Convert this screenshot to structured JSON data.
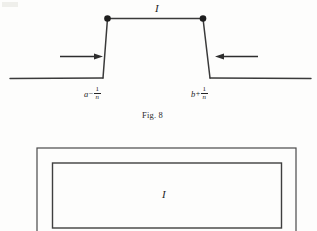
{
  "figure_top": {
    "name": "step-function-trapezoid-figure",
    "caption": "Fig. 8",
    "plateau_label": "I",
    "left_tick": {
      "variable": "a",
      "operator": "−",
      "numerator": "1",
      "denominator": "n"
    },
    "right_tick": {
      "variable": "b",
      "operator": "+",
      "numerator": "1",
      "denominator": "n"
    },
    "arrows": [
      {
        "name": "left-arrow",
        "direction": "right"
      },
      {
        "name": "right-arrow",
        "direction": "left"
      }
    ],
    "endpoint_dots": 2
  },
  "figure_bottom": {
    "name": "nested-rectangles-figure",
    "inner_label": "I",
    "rectangles": [
      "outer-rectangle",
      "inner-rectangle"
    ]
  },
  "colors": {
    "ink": "#242424",
    "line": "#3a3a3a",
    "paper": "#fdfdfc"
  }
}
